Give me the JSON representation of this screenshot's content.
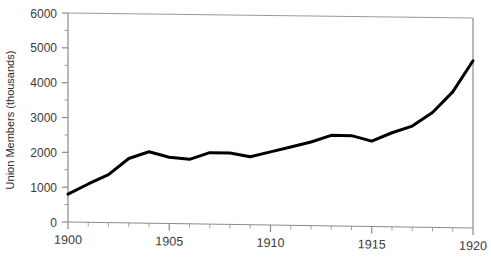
{
  "chart_data": {
    "type": "line",
    "title": "",
    "xlabel": "",
    "ylabel": "Union Members (thousands)",
    "xlim": [
      1900,
      1920
    ],
    "ylim": [
      0,
      6000
    ],
    "grid": false,
    "legend": null,
    "x_ticks": [
      "1900",
      "1905",
      "1910",
      "1915",
      "1920"
    ],
    "x_tick_values": [
      1900,
      1905,
      1910,
      1915,
      1920
    ],
    "x_minor_step": 1,
    "y_ticks": [
      "0",
      "1000",
      "2000",
      "3000",
      "4000",
      "5000",
      "6000"
    ],
    "y_tick_values": [
      0,
      1000,
      2000,
      3000,
      4000,
      5000,
      6000
    ],
    "y_minor_step": 500,
    "line_color": "#000000",
    "line_width": 3,
    "axis_color": "#7a7a7a",
    "x": [
      1900,
      1901,
      1902,
      1903,
      1904,
      1905,
      1906,
      1907,
      1908,
      1909,
      1910,
      1911,
      1912,
      1913,
      1914,
      1915,
      1916,
      1917,
      1918,
      1919,
      1920
    ],
    "values": [
      800,
      1100,
      1375,
      1850,
      2050,
      1900,
      1850,
      2050,
      2050,
      1950,
      2100,
      2250,
      2400,
      2600,
      2600,
      2450,
      2700,
      2900,
      3300,
      3900,
      4800
    ],
    "series": [
      {
        "name": "Union Members",
        "values": [
          800,
          1100,
          1375,
          1850,
          2050,
          1900,
          1850,
          2050,
          2050,
          1950,
          2100,
          2250,
          2400,
          2600,
          2600,
          2450,
          2700,
          2900,
          3300,
          3900,
          4800
        ]
      }
    ]
  }
}
